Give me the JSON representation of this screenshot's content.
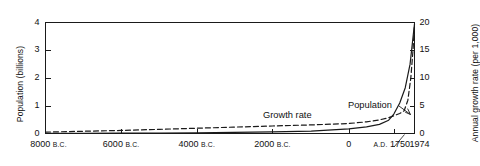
{
  "chart_data": {
    "type": "line",
    "title": "",
    "xlabel": "",
    "ylabel": "Population (billions)",
    "y2label": "Annual growth rate (per 1,000)",
    "ylim": [
      0,
      4
    ],
    "y2lim": [
      0,
      20
    ],
    "yticks": [
      "0",
      "1",
      "2",
      "3",
      "4"
    ],
    "y2ticks": [
      "0",
      "5",
      "10",
      "15",
      "20"
    ],
    "xticks": [
      {
        "label": "8000",
        "era": "B.C.",
        "pos": 0.0
      },
      {
        "label": "6000",
        "era": "B.C.",
        "pos": 0.205
      },
      {
        "label": "4000",
        "era": "B.C.",
        "pos": 0.41
      },
      {
        "label": "2000",
        "era": "B.C.",
        "pos": 0.615
      },
      {
        "label": "0",
        "era": "",
        "pos": 0.822
      },
      {
        "label": "1750",
        "era": "A.D.",
        "pos": 0.944
      },
      {
        "label": "1974",
        "era": "",
        "pos": 1.0
      }
    ],
    "grid": false,
    "legend_position": "inline-annotations",
    "series": [
      {
        "name": "Population",
        "style": "solid",
        "axis": "left",
        "units": "billions",
        "points": [
          {
            "x": 0.0,
            "y": 0.005
          },
          {
            "x": 0.1,
            "y": 0.008
          },
          {
            "x": 0.205,
            "y": 0.012
          },
          {
            "x": 0.31,
            "y": 0.018
          },
          {
            "x": 0.41,
            "y": 0.027
          },
          {
            "x": 0.51,
            "y": 0.038
          },
          {
            "x": 0.615,
            "y": 0.055
          },
          {
            "x": 0.72,
            "y": 0.085
          },
          {
            "x": 0.822,
            "y": 0.17
          },
          {
            "x": 0.87,
            "y": 0.24
          },
          {
            "x": 0.905,
            "y": 0.33
          },
          {
            "x": 0.93,
            "y": 0.48
          },
          {
            "x": 0.944,
            "y": 0.7
          },
          {
            "x": 0.96,
            "y": 1.1
          },
          {
            "x": 0.975,
            "y": 1.65
          },
          {
            "x": 0.988,
            "y": 2.5
          },
          {
            "x": 1.0,
            "y": 3.95
          }
        ]
      },
      {
        "name": "Growth rate",
        "style": "dashed",
        "axis": "right",
        "units": "per 1,000",
        "points": [
          {
            "x": 0.0,
            "y": 0.25
          },
          {
            "x": 0.1,
            "y": 0.4
          },
          {
            "x": 0.205,
            "y": 0.55
          },
          {
            "x": 0.31,
            "y": 0.75
          },
          {
            "x": 0.41,
            "y": 0.95
          },
          {
            "x": 0.51,
            "y": 1.15
          },
          {
            "x": 0.615,
            "y": 1.35
          },
          {
            "x": 0.72,
            "y": 1.55
          },
          {
            "x": 0.822,
            "y": 1.8
          },
          {
            "x": 0.87,
            "y": 2.1
          },
          {
            "x": 0.905,
            "y": 2.45
          },
          {
            "x": 0.93,
            "y": 2.85
          },
          {
            "x": 0.944,
            "y": 3.2
          },
          {
            "x": 0.96,
            "y": 3.6
          },
          {
            "x": 0.972,
            "y": 4.1
          },
          {
            "x": 0.982,
            "y": 6.0
          },
          {
            "x": 0.99,
            "y": 10.0
          },
          {
            "x": 0.996,
            "y": 15.0
          },
          {
            "x": 1.0,
            "y": 19.6
          }
        ]
      }
    ],
    "annotations": [
      {
        "name": "population-label",
        "text": "Population",
        "x_px": 348,
        "y_px": 100
      },
      {
        "name": "growth-rate-label",
        "text": "Growth rate",
        "x_px": 263,
        "y_px": 110
      }
    ],
    "colors": {
      "axis": "#1a1a1a",
      "population_line": "#1a1a1a",
      "growth_rate_line": "#1a1a1a",
      "background": "#ffffff"
    }
  }
}
